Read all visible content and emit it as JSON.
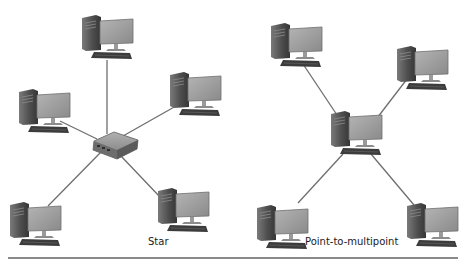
{
  "diagrams": [
    {
      "title": "Star",
      "center_device": "hub",
      "node_count": 5,
      "label_pos": {
        "x": 148,
        "y": 236
      }
    },
    {
      "title": "Point-to-multipoint",
      "center_device": "computer",
      "node_count": 4,
      "label_pos": {
        "x": 305,
        "y": 236
      }
    }
  ],
  "colors": {
    "link": "#6e6e6e",
    "tower": "#5a5a5a",
    "monitor": "#9a9a9a",
    "keyboard": "#3c3c3c",
    "hub": "#8c8c8c",
    "rule": "#8a8a8a"
  }
}
